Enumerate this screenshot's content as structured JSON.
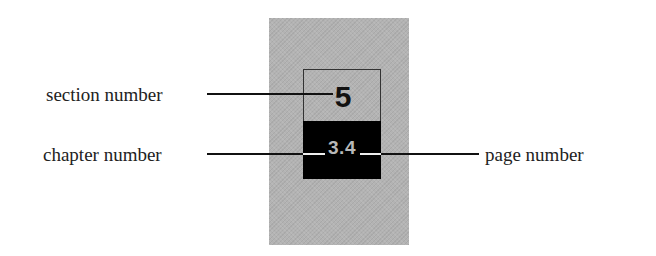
{
  "diagram": {
    "tab": {
      "section_number": "5",
      "chapter_page_number": "3.4"
    },
    "labels": {
      "section": "section number",
      "chapter": "chapter number",
      "page": "page number"
    },
    "colors": {
      "background_panel": "#b3b3b3",
      "tab_bottom": "#000000",
      "section_number_text": "#111111",
      "chapter_page_text": "#b8b8b8",
      "leader_lines": "#111111"
    }
  }
}
